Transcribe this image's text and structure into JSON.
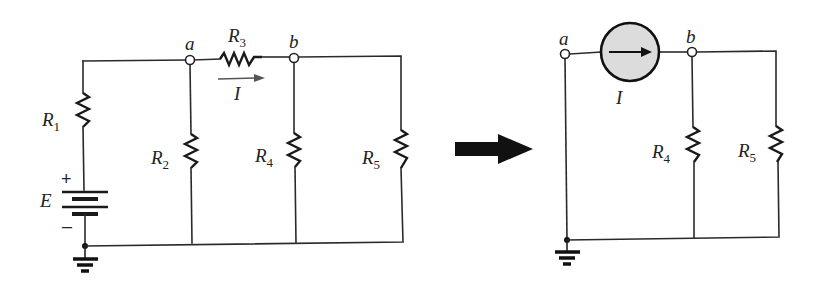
{
  "figure": {
    "left_circuit": {
      "nodes": {
        "a": "a",
        "b": "b"
      },
      "resistors": [
        {
          "id": "R1",
          "base": "R",
          "sub": "1"
        },
        {
          "id": "R2",
          "base": "R",
          "sub": "2"
        },
        {
          "id": "R3",
          "base": "R",
          "sub": "3"
        },
        {
          "id": "R4",
          "base": "R",
          "sub": "4"
        },
        {
          "id": "R5",
          "base": "R",
          "sub": "5"
        }
      ],
      "source": {
        "label": "E",
        "plus": "+",
        "minus": "–"
      },
      "current": {
        "label": "I"
      }
    },
    "transform_arrow": "right-arrow",
    "right_circuit": {
      "nodes": {
        "a": "a",
        "b": "b"
      },
      "current_source": {
        "label": "I"
      },
      "resistors": [
        {
          "id": "R4",
          "base": "R",
          "sub": "4"
        },
        {
          "id": "R5",
          "base": "R",
          "sub": "5"
        }
      ]
    },
    "colors": {
      "wire": "#2a2a2a",
      "current_source_fill": "#dcdcdc",
      "arrow": "#111111",
      "current_arrow": "#555555"
    }
  }
}
